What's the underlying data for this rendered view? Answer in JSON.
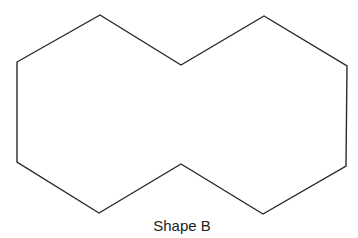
{
  "figure": {
    "caption": "Shape B",
    "shape": {
      "type": "polygon",
      "description": "ten-sided shape formed by two overlapping hexagons joined side by side",
      "stroke_color": "#2a2a2a",
      "fill_color": "#ffffff",
      "stroke_width": 1.4,
      "points": "17,62 100,15 181,65 264,16 347,66 346,166 263,214 181,164 99,213 17,162"
    }
  }
}
